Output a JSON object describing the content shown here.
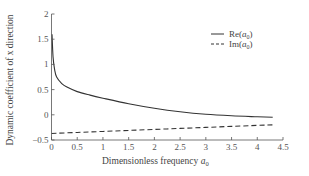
{
  "chart_data": {
    "type": "line",
    "title": "",
    "xlabel": "Dimensionless frequency a0",
    "ylabel": "Dynamic coefficient of x direction",
    "xlim": [
      0,
      4.5
    ],
    "ylim": [
      -0.5,
      2
    ],
    "xticks": [
      "0",
      "0.5",
      "1",
      "1.5",
      "2",
      "2.5",
      "3",
      "3.5",
      "4",
      "4.5"
    ],
    "yticks": [
      "-0.5",
      "0",
      "0.5",
      "1",
      "1.5",
      "2"
    ],
    "grid": false,
    "legend_position": "upper right",
    "series": [
      {
        "name": "Re(a0)",
        "style": "solid",
        "x": [
          0.01,
          0.03,
          0.06,
          0.1,
          0.2,
          0.3,
          0.5,
          0.75,
          1.0,
          1.5,
          2.0,
          2.5,
          3.0,
          3.5,
          4.0,
          4.3
        ],
        "values": [
          1.6,
          1.15,
          0.9,
          0.75,
          0.62,
          0.55,
          0.46,
          0.39,
          0.33,
          0.22,
          0.13,
          0.06,
          0.01,
          -0.02,
          -0.04,
          -0.05
        ]
      },
      {
        "name": "Im(a0)",
        "style": "dashed",
        "x": [
          0.0,
          0.5,
          1.0,
          1.5,
          2.0,
          2.5,
          3.0,
          3.5,
          4.0,
          4.3
        ],
        "values": [
          -0.37,
          -0.35,
          -0.33,
          -0.31,
          -0.29,
          -0.27,
          -0.25,
          -0.23,
          -0.21,
          -0.2
        ]
      }
    ]
  },
  "axes": {
    "x_label_text": "Dimensionless frequency ",
    "x_label_var": "a",
    "x_label_sub": "0",
    "y_label_text": "Dynamic coefficient of x direction"
  },
  "legend": {
    "items": [
      {
        "prefix": "Re(",
        "var": "a",
        "sub": "0",
        "suffix": ")"
      },
      {
        "prefix": "Im(",
        "var": "a",
        "sub": "0",
        "suffix": ")"
      }
    ]
  }
}
